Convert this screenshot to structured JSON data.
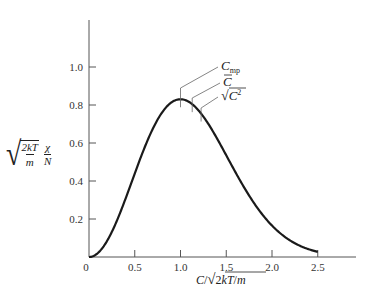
{
  "chart_data": {
    "type": "line",
    "title": "",
    "xlabel": "C/√(2kT/m)",
    "ylabel": "√(2kT/m) · χ/N",
    "xlim": [
      0,
      2.9
    ],
    "ylim": [
      0,
      1.2
    ],
    "xticks": [
      0,
      0.5,
      1.0,
      1.5,
      2.0,
      2.5
    ],
    "xtick_labels": [
      "0",
      "0.5",
      "1.0",
      "1.5",
      "2.0",
      "2.5"
    ],
    "yticks": [
      0.2,
      0.4,
      0.6,
      0.8,
      1.0
    ],
    "ytick_labels": [
      "0.2",
      "0.4",
      "0.6",
      "0.8",
      "1.0"
    ],
    "grid": false,
    "legend": null,
    "series": [
      {
        "name": "Maxwell speed distribution",
        "x": [
          0,
          0.1,
          0.2,
          0.3,
          0.4,
          0.5,
          0.6,
          0.7,
          0.8,
          0.9,
          1.0,
          1.1,
          1.2,
          1.3,
          1.4,
          1.5,
          1.6,
          1.7,
          1.8,
          1.9,
          2.0,
          2.1,
          2.2,
          2.3,
          2.4,
          2.5
        ],
        "y": [
          0,
          0.022,
          0.087,
          0.185,
          0.306,
          0.44,
          0.566,
          0.677,
          0.762,
          0.814,
          0.83,
          0.812,
          0.765,
          0.694,
          0.609,
          0.514,
          0.42,
          0.331,
          0.251,
          0.184,
          0.129,
          0.088,
          0.057,
          0.036,
          0.022,
          0.013
        ]
      }
    ],
    "annotations": [
      {
        "label": "C_mp",
        "x": 1.0,
        "text_main": "C",
        "text_sub": "mp"
      },
      {
        "label": "C̄",
        "x": 1.128,
        "text_main": "C̄"
      },
      {
        "label": "√(C̄²)",
        "x": 1.225,
        "text_main": "√C̄²"
      }
    ]
  },
  "labels": {
    "x_axis_c": "C",
    "x_axis_rest": "2kT",
    "x_axis_m": "m",
    "y_num": "2kT",
    "y_den": "m",
    "y_chi": "χ",
    "y_N": "N",
    "origin": "0"
  }
}
